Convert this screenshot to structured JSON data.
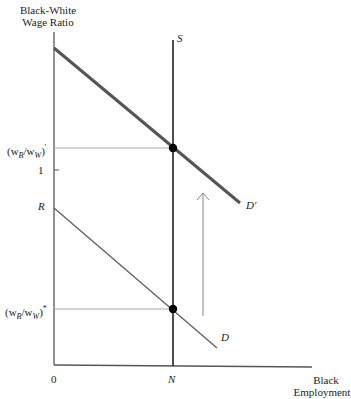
{
  "diagram": {
    "y_axis_label_line1": "Black-White",
    "y_axis_label_line2": "Wage Ratio",
    "x_axis_label_line1": "Black",
    "x_axis_label_line2": "Employment",
    "origin_label": "0",
    "x_tick_label": "N",
    "y_ticks": {
      "ratio_prime_base": "(w",
      "ratio_prime_sub_b": "B",
      "ratio_prime_mid": "/w",
      "ratio_prime_sub_w": "W",
      "ratio_prime_close": ")",
      "ratio_prime_mark": "'",
      "one": "1",
      "R": "R",
      "ratio_star_base": "(w",
      "ratio_star_sub_b": "B",
      "ratio_star_mid": "/w",
      "ratio_star_sub_w": "W",
      "ratio_star_close": ")",
      "ratio_star_mark": "*"
    },
    "curves": {
      "supply": "S",
      "demand": "D",
      "demand_shifted": "D'"
    },
    "colors": {
      "axis": "#555555",
      "supply": "#222222",
      "demand": "#666666",
      "demand_shifted": "#555555",
      "guide": "#aaaaaa",
      "arrow": "#888888",
      "point": "#000000"
    }
  }
}
